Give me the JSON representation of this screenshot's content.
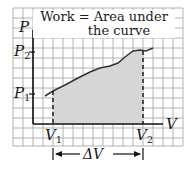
{
  "title_line1": "Work = Area under",
  "title_line2": "the curve",
  "axes": {
    "y_label": "P",
    "x_label": "V",
    "p2": "P",
    "p2_sub": "2",
    "p1": "P",
    "p1_sub": "1",
    "v1": "V",
    "v1_sub": "1",
    "v2": "V",
    "v2_sub": "2",
    "delta": "ΔV"
  },
  "colors": {
    "grid": "#9a9a9a",
    "shade": "#d9d9d9",
    "ink": "#1a1a1a"
  }
}
